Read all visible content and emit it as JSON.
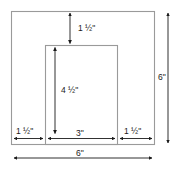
{
  "figure": {
    "type": "dimensioned-rectangle-diagram",
    "stroke_color": "#8c8c8c",
    "arrow_color": "#1a1a1a",
    "text_color": "#1a1a1a",
    "background_color": "#ffffff"
  },
  "shapes": {
    "outer_rectangle": {
      "name": "outer-frame",
      "width_label": "6\"",
      "height_label": "6\""
    },
    "inner_rectangle": {
      "name": "inner-opening",
      "width_label": "3\"",
      "height_label": "4 ½\""
    }
  },
  "dimensions": [
    {
      "id": "top-margin",
      "label": "1 ½\"",
      "whole": "1",
      "fraction": "½",
      "unit": "\"",
      "orientation": "vertical",
      "value_inches": 1.5,
      "describes": "top border height between outer frame top and inner rectangle top"
    },
    {
      "id": "inner-height",
      "label": "4 ½\"",
      "whole": "4",
      "fraction": "½",
      "unit": "\"",
      "orientation": "vertical",
      "value_inches": 4.5,
      "describes": "height of inner rectangle"
    },
    {
      "id": "left-margin",
      "label": "1 ½\"",
      "whole": "1",
      "fraction": "½",
      "unit": "\"",
      "orientation": "horizontal",
      "value_inches": 1.5,
      "describes": "left border width"
    },
    {
      "id": "inner-width",
      "label": "3\"",
      "whole": "3",
      "fraction": "",
      "unit": "\"",
      "orientation": "horizontal",
      "value_inches": 3,
      "describes": "width of inner rectangle"
    },
    {
      "id": "right-margin",
      "label": "1 ½\"",
      "whole": "1",
      "fraction": "½",
      "unit": "\"",
      "orientation": "horizontal",
      "value_inches": 1.5,
      "describes": "right border width"
    },
    {
      "id": "overall-height",
      "label": "6\"",
      "whole": "6",
      "fraction": "",
      "unit": "\"",
      "orientation": "vertical",
      "value_inches": 6,
      "describes": "total height of outer frame"
    },
    {
      "id": "overall-width",
      "label": "6\"",
      "whole": "6",
      "fraction": "",
      "unit": "\"",
      "orientation": "horizontal",
      "value_inches": 6,
      "describes": "total width of outer frame"
    }
  ],
  "labels": {
    "top_margin": "1 ½\"",
    "inner_height": "4 ½\"",
    "left_margin": "1 ½\"",
    "inner_width": "3\"",
    "right_margin": "1 ½\"",
    "overall_height": "6\"",
    "overall_width": "6\""
  }
}
